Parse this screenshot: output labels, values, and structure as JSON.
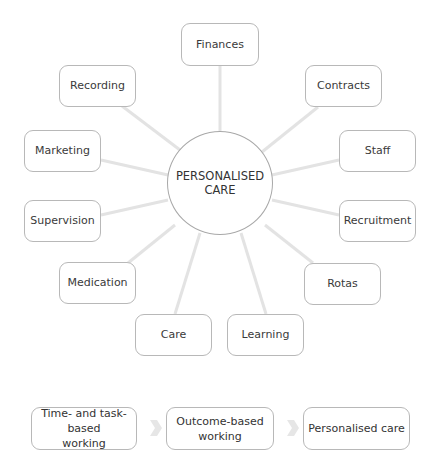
{
  "hub": {
    "line1": "PERSONALISED",
    "line2": "CARE"
  },
  "nodes": [
    {
      "label": "Finances"
    },
    {
      "label": "Recording"
    },
    {
      "label": "Contracts"
    },
    {
      "label": "Marketing"
    },
    {
      "label": "Staff"
    },
    {
      "label": "Supervision"
    },
    {
      "label": "Recruitment"
    },
    {
      "label": "Medication"
    },
    {
      "label": "Rotas"
    },
    {
      "label": "Care"
    },
    {
      "label": "Learning"
    }
  ],
  "flow": [
    {
      "line1": "Time- and task-based",
      "line2": "working"
    },
    {
      "line1": "Outcome-based",
      "line2": "working"
    },
    {
      "line1": "Personalised care",
      "line2": ""
    }
  ],
  "colors": {
    "line": "#e3e3e3",
    "border": "#b8b8b8",
    "arrow": "#e6e6e6"
  }
}
